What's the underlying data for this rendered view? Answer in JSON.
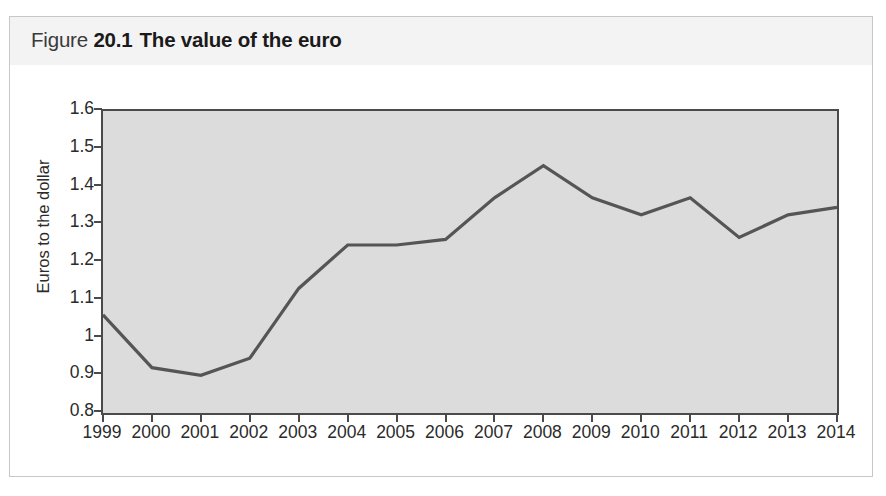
{
  "figure": {
    "label": "Figure",
    "number": "20.1",
    "title": "The value of the euro"
  },
  "chart_data": {
    "type": "line",
    "title": "The value of the euro",
    "xlabel": "",
    "ylabel": "Euros to the dollar",
    "categories": [
      "1999",
      "2000",
      "2001",
      "2002",
      "2003",
      "2004",
      "2005",
      "2006",
      "2007",
      "2008",
      "2009",
      "2010",
      "2011",
      "2012",
      "2013",
      "2014"
    ],
    "values": [
      1.06,
      0.92,
      0.9,
      0.945,
      1.13,
      1.245,
      1.245,
      1.26,
      1.37,
      1.455,
      1.37,
      1.325,
      1.37,
      1.265,
      1.325,
      1.345
    ],
    "series": [
      {
        "name": "Euros to the dollar",
        "values": [
          1.06,
          0.92,
          0.9,
          0.945,
          1.13,
          1.245,
          1.245,
          1.26,
          1.37,
          1.455,
          1.37,
          1.325,
          1.37,
          1.265,
          1.325,
          1.345
        ]
      }
    ],
    "ylim": [
      0.8,
      1.6
    ],
    "yticks": [
      0.8,
      0.9,
      1.0,
      1.1,
      1.2,
      1.3,
      1.4,
      1.5,
      1.6
    ],
    "ytick_labels": [
      "0.8",
      "0.9",
      "1",
      "1.1",
      "1.2",
      "1.3",
      "1.4",
      "1.5",
      "1.6"
    ],
    "xtick_labels": [
      "1999",
      "2000",
      "2001",
      "2002",
      "2003",
      "2004",
      "2005",
      "2006",
      "2007",
      "2008",
      "2009",
      "2010",
      "2011",
      "2012",
      "2013",
      "2014"
    ],
    "grid": false,
    "legend": false,
    "line_color": "#555555",
    "plot_background": "#dcdcdc",
    "axis_color": "#4a4a4a",
    "header_background": "#f3f3f3"
  }
}
